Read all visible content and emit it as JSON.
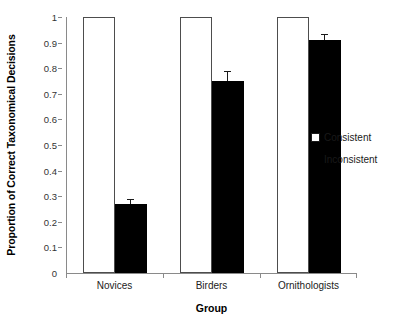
{
  "chart_data": {
    "type": "bar",
    "title": "",
    "subtitle": "",
    "xlabel": "Group",
    "ylabel": "Proportion of Correct Taxonomical Decisions",
    "categories": [
      "Novices",
      "Birders",
      "Ornithologists"
    ],
    "series": [
      {
        "name": "Consistent",
        "values": [
          1.0,
          1.0,
          1.0
        ],
        "errors": [
          0,
          0,
          0
        ],
        "color": "#ffffff",
        "edge_color": "#4d4d4d",
        "marker": "open-square"
      },
      {
        "name": "Inconsistent",
        "values": [
          0.27,
          0.75,
          0.91
        ],
        "errors": [
          0.02,
          0.04,
          0.025
        ],
        "color": "#000000",
        "edge_color": "#000000",
        "marker": "filled-square"
      }
    ],
    "ylim": [
      0,
      1
    ],
    "ytick_labels": [
      "0",
      "0.1",
      "0.2",
      "0.3",
      "0.4",
      "0.5",
      "0.6",
      "0.7",
      "0.8",
      "0.9",
      "1"
    ],
    "ytick_values": [
      0,
      0.1,
      0.2,
      0.3,
      0.4,
      0.5,
      0.6,
      0.7,
      0.8,
      0.9,
      1
    ],
    "grid": false,
    "legend_position": "right-middle",
    "legend_entries": [
      "Consistent",
      "Inconsistent"
    ],
    "error_bars": true,
    "annotations": []
  },
  "axes": {
    "y_title": "Proportion of Correct Taxonomical Decisions",
    "x_title": "Group"
  },
  "legend": {
    "items": [
      {
        "label": "Consistent",
        "swatch": "open-square-swatch"
      },
      {
        "label": "Inconsistent",
        "swatch": "filled-square-swatch"
      }
    ]
  }
}
